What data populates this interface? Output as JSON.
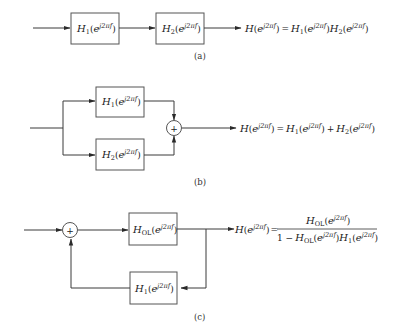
{
  "diagram": {
    "panels": [
      {
        "id": "a",
        "caption": "(a)",
        "type": "cascade",
        "blocks": [
          {
            "name": "H",
            "sub": "1",
            "arg": "j2πf"
          },
          {
            "name": "H",
            "sub": "2",
            "arg": "j2πf"
          }
        ],
        "equation": "H(e^{j2πf}) = H_1(e^{j2πf})H_2(e^{j2πf})"
      },
      {
        "id": "b",
        "caption": "(b)",
        "type": "parallel",
        "blocks": [
          {
            "name": "H",
            "sub": "1",
            "arg": "j2πf"
          },
          {
            "name": "H",
            "sub": "2",
            "arg": "j2πf"
          }
        ],
        "summer": "+",
        "equation": "H(e^{j2πf}) = H_1(e^{j2πf}) + H_2(e^{j2πf})"
      },
      {
        "id": "c",
        "caption": "(c)",
        "type": "feedback",
        "blocks": [
          {
            "name": "H",
            "sub": "OL",
            "arg": "j2πf"
          },
          {
            "name": "H",
            "sub": "1",
            "arg": "j2πf"
          }
        ],
        "summer": "+",
        "equation_lhs": "H(e^{j2πf}) =",
        "equation_numerator": "H_OL(e^{j2πf})",
        "equation_denominator": "1 − H_OL(e^{j2πf})H_1(e^{j2πf})"
      }
    ],
    "text": {
      "H": "H",
      "e": "e",
      "arg": "j2πf",
      "sub1": "1",
      "sub2": "2",
      "subOL": "OL",
      "lp": "(",
      "rp": ")",
      "eq": "=",
      "plus": "+",
      "one_minus": "1 −",
      "cap_a": "(a)",
      "cap_b": "(b)",
      "cap_c": "(c)",
      "sum_sign": "+"
    },
    "colors": {
      "line": "#3a3a3a",
      "box": "#555555",
      "text": "#222222"
    }
  }
}
